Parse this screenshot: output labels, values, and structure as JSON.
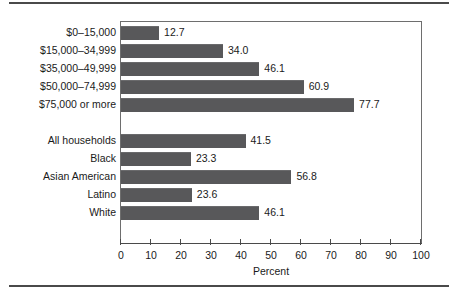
{
  "chart_data": {
    "type": "bar",
    "orientation": "horizontal",
    "title": "",
    "xlabel": "Percent",
    "ylabel": "",
    "xlim": [
      0,
      100
    ],
    "xticks": [
      0,
      10,
      20,
      30,
      40,
      50,
      60,
      70,
      80,
      90,
      100
    ],
    "xtick_labels": [
      "0",
      "10",
      "20",
      "30",
      "40",
      "50",
      "60",
      "70",
      "80",
      "90",
      "100"
    ],
    "grid": false,
    "legend": false,
    "bar_color": "#58585a",
    "groups": [
      {
        "name": "household-income",
        "categories": [
          "$0–15,000",
          "$15,000–34,999",
          "$35,000–49,999",
          "$50,000–74,999",
          "$75,000 or more"
        ],
        "values": [
          12.7,
          34.0,
          46.1,
          60.9,
          77.7
        ],
        "value_labels": [
          "12.7",
          "34.0",
          "46.1",
          "60.9",
          "77.7"
        ]
      },
      {
        "name": "race-ethnicity",
        "categories": [
          "All households",
          "Black",
          "Asian American",
          "Latino",
          "White"
        ],
        "values": [
          41.5,
          23.3,
          56.8,
          23.6,
          46.1
        ],
        "value_labels": [
          "41.5",
          "23.3",
          "56.8",
          "23.6",
          "46.1"
        ]
      }
    ],
    "categories": [
      "$0–15,000",
      "$15,000–34,999",
      "$35,000–49,999",
      "$50,000–74,999",
      "$75,000 or more",
      "All households",
      "Black",
      "Asian American",
      "Latino",
      "White"
    ],
    "values": [
      12.7,
      34.0,
      46.1,
      60.9,
      77.7,
      41.5,
      23.3,
      56.8,
      23.6,
      46.1
    ]
  }
}
